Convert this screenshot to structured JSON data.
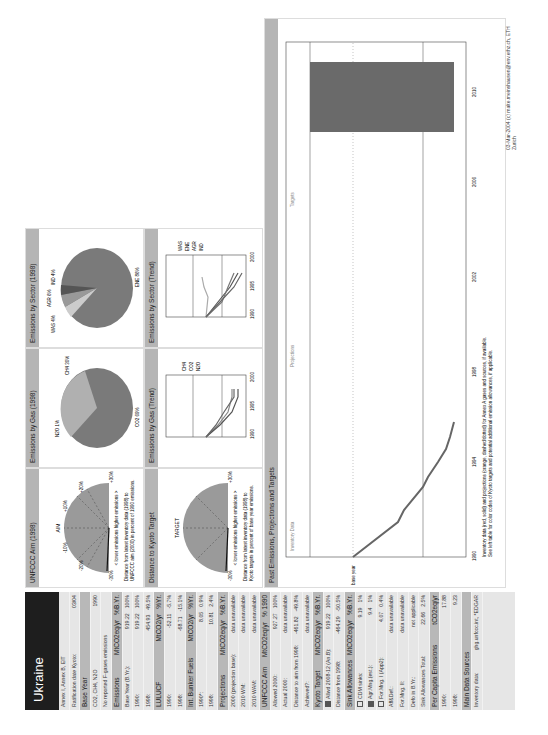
{
  "country": "Ukraine",
  "sidebar": {
    "rows": [
      {
        "label": "Annex I, Annex B, EIT",
        "v": [
          ""
        ],
        "hdr": false
      },
      {
        "label": "Ratification date Kyoto:",
        "v": [
          "03/04"
        ],
        "hdr": false
      },
      {
        "label": "Base Year",
        "v": [
          ""
        ],
        "hdr": true
      },
      {
        "label": "CO2, CH4, N2O",
        "v": [
          "1990"
        ],
        "hdr": false
      },
      {
        "label": "No reported F-gases emissions",
        "v": [
          ""
        ],
        "hdr": false
      },
      {
        "label": "Emissions",
        "v": [
          "MtCO2eq/yr",
          "%B.Yr."
        ],
        "hdr": true
      },
      {
        "label": "Base Year (B.Yr.):",
        "v": [
          "919.22",
          "100%"
        ],
        "hdr": false
      },
      {
        "label": "1990:",
        "v": [
          "919.22",
          "100%"
        ],
        "hdr": false
      },
      {
        "label": "1998:",
        "v": [
          "454.93",
          "49.5%"
        ],
        "hdr": false
      },
      {
        "label": "LULUCF",
        "v": [
          "MtCO2/yr",
          "%Yr."
        ],
        "hdr": true
      },
      {
        "label": "1990:",
        "v": [
          "-52.11",
          "-5.7%"
        ],
        "hdr": false
      },
      {
        "label": "1998:",
        "v": [
          "-68.71",
          "-15.1%"
        ],
        "hdr": false
      },
      {
        "label": "Int. Bunker Fuels",
        "v": [
          "MtCO2/yr",
          "%Yr."
        ],
        "hdr": true
      },
      {
        "label": "1990*:",
        "v": [
          "8.05",
          "0.9%"
        ],
        "hdr": false
      },
      {
        "label": "1998:",
        "v": [
          "10.81",
          "2.4%"
        ],
        "hdr": false
      },
      {
        "label": "Projections",
        "v": [
          "MtCO2eq/yr",
          "%B.Yr."
        ],
        "hdr": true
      },
      {
        "label": "2000 (projection base):",
        "v": [
          "data unavailable"
        ],
        "hdr": false
      },
      {
        "label": "2010 WM:",
        "v": [
          "data unavailable"
        ],
        "hdr": false
      },
      {
        "label": "2010 WAM:",
        "v": [
          "data unavailable"
        ],
        "hdr": false
      },
      {
        "label": "UNFCCC Aim",
        "v": [
          "MtCO2eq/yr",
          "% 1990"
        ],
        "hdr": true
      },
      {
        "label": "Allowed 2000:",
        "v": [
          "927.27",
          "100%"
        ],
        "hdr": false
      },
      {
        "label": "Actual 2000:",
        "v": [
          "data unavailable"
        ],
        "hdr": false
      },
      {
        "label": "Distance to aim from 1998:",
        "v": [
          "-461.82",
          "-49.8%"
        ],
        "hdr": false
      },
      {
        "label": "Achieved?:",
        "v": [
          "data unavailable"
        ],
        "hdr": false
      },
      {
        "label": "Kyoto Target",
        "v": [
          "MtCO2eq/yr",
          "%B.Yr."
        ],
        "hdr": true
      },
      {
        "label": "Allwd 2008-12 (An.B):",
        "v": [
          "919.22",
          "100%"
        ],
        "hdr": false,
        "chk": "f"
      },
      {
        "label": "Distance from 1998:",
        "v": [
          "-464.29",
          "-50.5%"
        ],
        "hdr": false
      },
      {
        "label": "Sink Allowances",
        "v": [
          "MtCO2eq/yr",
          "%B.Yr."
        ],
        "hdr": true
      },
      {
        "label": "CDM sinks:",
        "v": [
          "9.19",
          "1%"
        ],
        "hdr": false,
        "chk": "e"
      },
      {
        "label": "Agr.Mng.(est.):",
        "v": [
          "9.4",
          "1%"
        ],
        "hdr": false,
        "chk": "f"
      },
      {
        "label": "For.Mng. I (App2):",
        "v": [
          "4.07",
          "0.4%"
        ],
        "hdr": false,
        "chk": "e"
      },
      {
        "label": "Aff&Def.:",
        "v": [
          "data unavailable"
        ],
        "hdr": false
      },
      {
        "label": "For.Mng. II:",
        "v": [
          "data unavailable"
        ],
        "hdr": false
      },
      {
        "label": "Defo in B.Yr.:",
        "v": [
          "not applicable"
        ],
        "hdr": false
      },
      {
        "label": "Sink Allowances Total:",
        "v": [
          "22.66",
          "2.5%"
        ],
        "hdr": false
      },
      {
        "label": "Per Capita Emissions",
        "v": [
          "tCO2eq/yr"
        ],
        "hdr": true
      },
      {
        "label": "1990:",
        "v": [
          "17.88"
        ],
        "hdr": false
      },
      {
        "label": "1998:",
        "v": [
          "9.23"
        ],
        "hdr": false
      },
      {
        "label": "Main Data Sources",
        "v": [
          ""
        ],
        "hdr": true
      },
      {
        "label": "Inventory data:",
        "v": [
          "ghg.unfccc.int, *EDGAR"
        ],
        "hdr": false
      }
    ]
  },
  "panels": {
    "aim": {
      "title": "UNFCCC Aim (1998)",
      "label": "AIM",
      "legend": "< lower emissions    higher emissions >",
      "caption1": "Distance from latest inventory data (1998) to",
      "caption2": "UNFCCC aim (2000) in percent of 1990 emissions."
    },
    "kyoto": {
      "title": "Distance to Kyoto Target",
      "label": "TARGET",
      "legend": "< lower emissions    higher emissions >",
      "caption1": "Distance from latest inventory data (1998) to",
      "caption2": "Kyoto targets in percent of base year emissions."
    },
    "gas_pie": {
      "title": "Emissions by Gas (1998)",
      "labels": [
        "N2O 1%",
        "CH4 30%",
        "CO2 69%"
      ]
    },
    "gas_trend": {
      "title": "Emissions by Gas (Trend)",
      "legend": [
        "CH4",
        "CO2",
        "N2O"
      ]
    },
    "sector_pie": {
      "title": "Emissions by Sector (1998)",
      "labels": [
        "WAS 4%",
        "AGR 6%",
        "IND 4%",
        "ENE 86%"
      ]
    },
    "sector_trend": {
      "title": "Emissions by Sector (Trend)",
      "legend": [
        "WAS",
        "ENE",
        "AGR",
        "IND"
      ]
    },
    "past": {
      "title": "Past Emissions, Projections and Targets",
      "zones": [
        "Inventory Data",
        "Projections",
        "Targets"
      ],
      "note1": "Inventory data (red, solid) and projections (orange, dashed/dotted) for Annex A gases and sources, if available.",
      "note2": "See left table for color codes of Kyoto targets and potential additional emission allowances, if applicable."
    }
  },
  "gauge_ticks": [
    "-30%",
    "-20%",
    "-10%",
    "+10%",
    "+20%",
    "+30%"
  ],
  "trend_yticks": [
    "+100%",
    "+50%",
    "+20%",
    "+10%",
    "base year",
    "-10%",
    "-20%",
    "-50%",
    "-100%"
  ],
  "trend_xticks": [
    "1990",
    "1995",
    "2000"
  ],
  "footer": "03-Mar-2004 (c) malte.meinshausen@env.ethz.ch, ETH Zurich",
  "chart_data": [
    {
      "type": "pie",
      "title": "Emissions by Gas (1998)",
      "categories": [
        "CO2",
        "CH4",
        "N2O"
      ],
      "values": [
        69,
        30,
        1
      ]
    },
    {
      "type": "pie",
      "title": "Emissions by Sector (1998)",
      "categories": [
        "ENE",
        "AGR",
        "IND",
        "WAS"
      ],
      "values": [
        86,
        6,
        4,
        4
      ]
    },
    {
      "type": "line",
      "title": "Past Emissions, Projections and Targets",
      "x": [
        1990,
        1991,
        1992,
        1993,
        1994,
        1995,
        1996,
        1997,
        1998
      ],
      "values": [
        0,
        -28,
        -33,
        -40,
        -44,
        -48,
        -50,
        -52,
        -50.5
      ],
      "ylabel": "% of base year",
      "xlim": [
        1990,
        2012
      ],
      "yticks": [
        "+60%",
        "+50%",
        "+40%",
        "+30%",
        "+20%",
        "+10%",
        "base year",
        "-10%",
        "-20%",
        "-30%",
        "-40%",
        "-50%",
        "-60%"
      ],
      "xticks": [
        "1990",
        "1992",
        "1994",
        "1996",
        "1998",
        "2000",
        "2002",
        "2004",
        "2006",
        "2008",
        "2010",
        "2012"
      ],
      "target_bar": {
        "x_start": 2008,
        "x_end": 2012,
        "value": "0% (Kyoto 100% B.Yr.)"
      }
    }
  ]
}
